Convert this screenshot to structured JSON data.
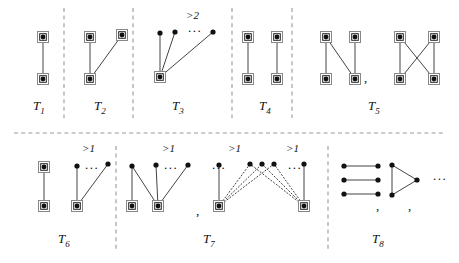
{
  "figure": {
    "background": "#ffffff",
    "edge_color": "#444444",
    "node_color": "#111111",
    "box_color": "#888888",
    "divider_color": "#999999",
    "width": 459,
    "height": 263
  },
  "captions": [
    {
      "name": "t1",
      "base": "T",
      "sub": "1",
      "x": 33,
      "y": 98
    },
    {
      "name": "t2",
      "base": "T",
      "sub": "2",
      "x": 94,
      "y": 98
    },
    {
      "name": "t3",
      "base": "T",
      "sub": "3",
      "x": 172,
      "y": 98
    },
    {
      "name": "t4",
      "base": "T",
      "sub": "4",
      "x": 259,
      "y": 98
    },
    {
      "name": "t5",
      "base": "T",
      "sub": "5",
      "x": 368,
      "y": 98
    },
    {
      "name": "t6",
      "base": "T",
      "sub": "6",
      "x": 58,
      "y": 231
    },
    {
      "name": "t7",
      "base": "T",
      "sub": "7",
      "x": 203,
      "y": 231
    },
    {
      "name": "t8",
      "base": "T",
      "sub": "8",
      "x": 372,
      "y": 231
    }
  ],
  "multiplicity_labels": [
    {
      "name": "t3-multiplicity",
      "text": ">2",
      "x": 186,
      "y": 9
    },
    {
      "name": "t6-multiplicity",
      "text": ">1",
      "x": 82,
      "y": 142
    },
    {
      "name": "t7a-multiplicity",
      "text": ">1",
      "x": 162,
      "y": 142
    },
    {
      "name": "t7b-multiplicity",
      "text": ">1",
      "x": 228,
      "y": 142
    },
    {
      "name": "t7c-multiplicity",
      "text": ">1",
      "x": 286,
      "y": 142
    }
  ],
  "ellipses": [
    {
      "name": "t3-ellipsis",
      "text": "...",
      "x": 188,
      "y": 20
    },
    {
      "name": "t6-ellipsis",
      "text": "...",
      "x": 85,
      "y": 157
    },
    {
      "name": "t7a-ellipsis",
      "text": "...",
      "x": 164,
      "y": 157
    },
    {
      "name": "t7b-ellipsis",
      "text": "...",
      "x": 212,
      "y": 157
    },
    {
      "name": "t7c-ellipsis",
      "text": "...",
      "x": 288,
      "y": 157
    },
    {
      "name": "t8-ellipsis",
      "text": "...",
      "x": 433,
      "y": 168
    }
  ],
  "commas": [
    {
      "name": "t5-comma",
      "x": 364,
      "y": 70
    },
    {
      "name": "t7-comma",
      "x": 196,
      "y": 203
    },
    {
      "name": "t8-comma-1",
      "x": 376,
      "y": 198
    },
    {
      "name": "t8-comma-2",
      "x": 408,
      "y": 198
    }
  ],
  "dividers": {
    "horizontal": [
      {
        "name": "row-divider",
        "x1": 14,
        "y1": 133,
        "x2": 446,
        "y2": 133
      }
    ],
    "vertical": [
      {
        "name": "divider-t1-t2",
        "x1": 64,
        "y1": 8,
        "x2": 64,
        "y2": 118
      },
      {
        "name": "divider-t2-t3",
        "x1": 133,
        "y1": 8,
        "x2": 133,
        "y2": 118
      },
      {
        "name": "divider-t3-t4",
        "x1": 232,
        "y1": 8,
        "x2": 232,
        "y2": 118
      },
      {
        "name": "divider-t4-t5",
        "x1": 292,
        "y1": 8,
        "x2": 292,
        "y2": 118
      },
      {
        "name": "divider-t6-t7",
        "x1": 116,
        "y1": 146,
        "x2": 116,
        "y2": 252
      },
      {
        "name": "divider-t7-t8",
        "x1": 328,
        "y1": 146,
        "x2": 328,
        "y2": 252
      }
    ]
  },
  "graphs": {
    "t1": {
      "name": "graph-t1",
      "nodes": [
        {
          "id": "a",
          "x": 43,
          "y": 37,
          "boxed": true
        },
        {
          "id": "b",
          "x": 43,
          "y": 79,
          "boxed": true
        }
      ],
      "edges": [
        {
          "from": "a",
          "to": "b",
          "style": "solid"
        }
      ]
    },
    "t2": {
      "name": "graph-t2",
      "nodes": [
        {
          "id": "a",
          "x": 90,
          "y": 37,
          "boxed": true
        },
        {
          "id": "b",
          "x": 122,
          "y": 35,
          "boxed": true
        },
        {
          "id": "c",
          "x": 90,
          "y": 79,
          "boxed": true
        }
      ],
      "edges": [
        {
          "from": "a",
          "to": "c",
          "style": "solid"
        },
        {
          "from": "b",
          "to": "c",
          "style": "solid"
        }
      ]
    },
    "t3": {
      "name": "graph-t3",
      "nodes": [
        {
          "id": "hub",
          "x": 160,
          "y": 77,
          "boxed": true
        },
        {
          "id": "p1",
          "x": 160,
          "y": 33,
          "boxed": false
        },
        {
          "id": "p2",
          "x": 175,
          "y": 32,
          "boxed": false
        },
        {
          "id": "p3",
          "x": 213,
          "y": 32,
          "boxed": false
        }
      ],
      "edges": [
        {
          "from": "hub",
          "to": "p1",
          "style": "solid"
        },
        {
          "from": "hub",
          "to": "p2",
          "style": "solid"
        },
        {
          "from": "hub",
          "to": "p3",
          "style": "solid"
        }
      ]
    },
    "t4": {
      "name": "graph-t4",
      "nodes": [
        {
          "id": "a",
          "x": 248,
          "y": 37,
          "boxed": true
        },
        {
          "id": "b",
          "x": 277,
          "y": 37,
          "boxed": true
        },
        {
          "id": "c",
          "x": 248,
          "y": 79,
          "boxed": true
        },
        {
          "id": "d",
          "x": 277,
          "y": 79,
          "boxed": true
        }
      ],
      "edges": [
        {
          "from": "a",
          "to": "c",
          "style": "solid"
        },
        {
          "from": "b",
          "to": "d",
          "style": "solid"
        }
      ]
    },
    "t5a": {
      "name": "graph-t5-variant-1",
      "nodes": [
        {
          "id": "a",
          "x": 326,
          "y": 37,
          "boxed": true
        },
        {
          "id": "b",
          "x": 355,
          "y": 37,
          "boxed": true
        },
        {
          "id": "c",
          "x": 326,
          "y": 79,
          "boxed": true
        },
        {
          "id": "d",
          "x": 355,
          "y": 79,
          "boxed": true
        }
      ],
      "edges": [
        {
          "from": "a",
          "to": "c",
          "style": "solid"
        },
        {
          "from": "a",
          "to": "d",
          "style": "solid"
        },
        {
          "from": "b",
          "to": "d",
          "style": "solid"
        }
      ]
    },
    "t5b": {
      "name": "graph-t5-variant-2",
      "nodes": [
        {
          "id": "a",
          "x": 400,
          "y": 37,
          "boxed": true
        },
        {
          "id": "b",
          "x": 434,
          "y": 37,
          "boxed": true
        },
        {
          "id": "c",
          "x": 400,
          "y": 79,
          "boxed": true
        },
        {
          "id": "d",
          "x": 434,
          "y": 79,
          "boxed": true
        }
      ],
      "edges": [
        {
          "from": "a",
          "to": "c",
          "style": "solid"
        },
        {
          "from": "a",
          "to": "d",
          "style": "solid"
        },
        {
          "from": "b",
          "to": "c",
          "style": "solid"
        },
        {
          "from": "b",
          "to": "d",
          "style": "solid"
        }
      ]
    },
    "t6": {
      "name": "graph-t6",
      "nodes": [
        {
          "id": "a",
          "x": 44,
          "y": 167,
          "boxed": true
        },
        {
          "id": "b",
          "x": 44,
          "y": 206,
          "boxed": true
        },
        {
          "id": "hub",
          "x": 77,
          "y": 206,
          "boxed": true
        },
        {
          "id": "p1",
          "x": 77,
          "y": 166,
          "boxed": false
        },
        {
          "id": "p2",
          "x": 108,
          "y": 164,
          "boxed": false
        }
      ],
      "edges": [
        {
          "from": "a",
          "to": "b",
          "style": "solid"
        },
        {
          "from": "hub",
          "to": "p1",
          "style": "solid"
        },
        {
          "from": "hub",
          "to": "p2",
          "style": "solid"
        }
      ]
    },
    "t7a": {
      "name": "graph-t7-variant-1",
      "nodes": [
        {
          "id": "l",
          "x": 132,
          "y": 206,
          "boxed": true
        },
        {
          "id": "hub",
          "x": 158,
          "y": 206,
          "boxed": true
        },
        {
          "id": "p1",
          "x": 132,
          "y": 166,
          "boxed": false
        },
        {
          "id": "p2",
          "x": 156,
          "y": 165,
          "boxed": false
        },
        {
          "id": "p3",
          "x": 188,
          "y": 165,
          "boxed": false
        }
      ],
      "edges": [
        {
          "from": "l",
          "to": "p1",
          "style": "solid"
        },
        {
          "from": "hub",
          "to": "p1",
          "style": "solid"
        },
        {
          "from": "hub",
          "to": "p2",
          "style": "solid"
        },
        {
          "from": "hub",
          "to": "p3",
          "style": "solid"
        }
      ]
    },
    "t7b": {
      "name": "graph-t7-variant-2",
      "nodes": [
        {
          "id": "lhub",
          "x": 219,
          "y": 206,
          "boxed": true
        },
        {
          "id": "rhub",
          "x": 304,
          "y": 206,
          "boxed": true
        },
        {
          "id": "p1",
          "x": 219,
          "y": 165,
          "boxed": false
        },
        {
          "id": "p2",
          "x": 250,
          "y": 164,
          "boxed": false
        },
        {
          "id": "p3",
          "x": 262,
          "y": 164,
          "boxed": false
        },
        {
          "id": "p4",
          "x": 274,
          "y": 164,
          "boxed": false
        },
        {
          "id": "p5",
          "x": 304,
          "y": 164,
          "boxed": false
        }
      ],
      "edges": [
        {
          "from": "lhub",
          "to": "p1",
          "style": "solid"
        },
        {
          "from": "rhub",
          "to": "p5",
          "style": "solid"
        },
        {
          "from": "lhub",
          "to": "p2",
          "style": "dotted"
        },
        {
          "from": "lhub",
          "to": "p3",
          "style": "dotted"
        },
        {
          "from": "lhub",
          "to": "p4",
          "style": "dotted"
        },
        {
          "from": "rhub",
          "to": "p2",
          "style": "dotted"
        },
        {
          "from": "rhub",
          "to": "p3",
          "style": "dotted"
        },
        {
          "from": "rhub",
          "to": "p4",
          "style": "dotted"
        }
      ]
    },
    "t8a": {
      "name": "graph-t8-variant-1",
      "nodes": [
        {
          "id": "l1",
          "x": 344,
          "y": 166,
          "boxed": false
        },
        {
          "id": "r1",
          "x": 378,
          "y": 166,
          "boxed": false
        },
        {
          "id": "l2",
          "x": 344,
          "y": 180,
          "boxed": false
        },
        {
          "id": "r2",
          "x": 378,
          "y": 180,
          "boxed": false
        },
        {
          "id": "l3",
          "x": 344,
          "y": 194,
          "boxed": false
        },
        {
          "id": "r3",
          "x": 378,
          "y": 194,
          "boxed": false
        }
      ],
      "edges": [
        {
          "from": "l1",
          "to": "r1",
          "style": "solid"
        },
        {
          "from": "l2",
          "to": "r2",
          "style": "solid"
        },
        {
          "from": "l3",
          "to": "r3",
          "style": "solid"
        }
      ]
    },
    "t8b": {
      "name": "graph-t8-variant-2",
      "nodes": [
        {
          "id": "a",
          "x": 392,
          "y": 165,
          "boxed": false
        },
        {
          "id": "b",
          "x": 392,
          "y": 195,
          "boxed": false
        },
        {
          "id": "c",
          "x": 417,
          "y": 180,
          "boxed": false
        }
      ],
      "edges": [
        {
          "from": "a",
          "to": "b",
          "style": "solid"
        },
        {
          "from": "a",
          "to": "c",
          "style": "solid"
        },
        {
          "from": "b",
          "to": "c",
          "style": "solid"
        }
      ]
    }
  }
}
